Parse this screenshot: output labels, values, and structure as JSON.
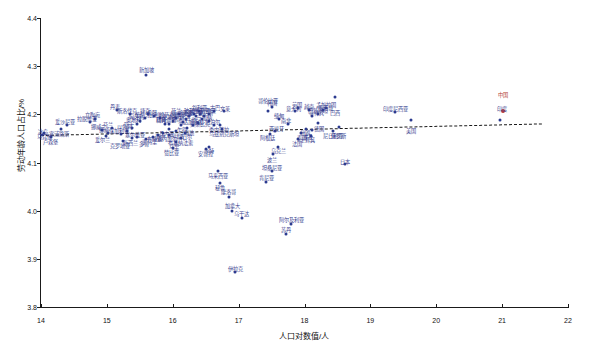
{
  "chart_data": {
    "type": "scatter",
    "title": "",
    "xlabel": "人口对数值/人",
    "ylabel": "劳动年龄人口占比/%",
    "xlim": [
      14,
      22
    ],
    "ylim": [
      3.8,
      4.4
    ],
    "xticks": [
      "14",
      "15",
      "16",
      "17",
      "18",
      "19",
      "20",
      "21",
      "22"
    ],
    "yticks": [
      "3.8",
      "3.9",
      "4.0",
      "4.1",
      "4.2",
      "4.3",
      "4.4"
    ],
    "grid": false,
    "legend": "none",
    "trendline": {
      "x0": 14.0,
      "y0": 4.158,
      "x1": 21.6,
      "y1": 4.182,
      "style": "dashed"
    },
    "highlight_color": "#c0392b",
    "point_color": "#2b3a8f",
    "label_color": "#3a3f8f",
    "points": [
      {
        "label": "中国",
        "x": 21.02,
        "y": 4.206,
        "highlight": true,
        "lx": 21.02,
        "ly": 4.243
      },
      {
        "label": "印度",
        "x": 20.97,
        "y": 4.189,
        "highlight": false,
        "lx": 21.0,
        "ly": 4.213
      },
      {
        "label": "美国",
        "x": 19.62,
        "y": 4.188,
        "highlight": false,
        "lx": 19.62,
        "ly": 4.168
      },
      {
        "label": "印度尼西亚",
        "x": 19.38,
        "y": 4.205,
        "highlight": false,
        "lx": 19.38,
        "ly": 4.213
      },
      {
        "label": "巴西",
        "x": 18.47,
        "y": 4.236,
        "highlight": false,
        "lx": 18.47,
        "ly": 4.205
      },
      {
        "label": "日本",
        "x": 18.62,
        "y": 4.096,
        "highlight": false,
        "lx": 18.62,
        "ly": 4.104
      },
      {
        "label": "俄罗斯",
        "x": 18.52,
        "y": 4.173,
        "highlight": false,
        "lx": 18.52,
        "ly": 4.158
      },
      {
        "label": "尼日利亚",
        "x": 18.44,
        "y": 4.166,
        "highlight": false,
        "lx": 18.44,
        "ly": 4.158
      },
      {
        "label": "孟加拉国",
        "x": 18.33,
        "y": 4.214,
        "highlight": false,
        "lx": 18.33,
        "ly": 4.222
      },
      {
        "label": "墨西哥",
        "x": 18.28,
        "y": 4.209,
        "highlight": false,
        "lx": 18.32,
        "ly": 4.216
      },
      {
        "label": "巴基斯坦",
        "x": 18.2,
        "y": 4.2,
        "highlight": false,
        "lx": 18.2,
        "ly": 4.208
      },
      {
        "label": "菲律宾",
        "x": 18.12,
        "y": 4.196,
        "highlight": false,
        "lx": 18.18,
        "ly": 4.204
      },
      {
        "label": "越南",
        "x": 18.07,
        "y": 4.21,
        "highlight": false,
        "lx": 18.07,
        "ly": 4.218
      },
      {
        "label": "埃及",
        "x": 18.03,
        "y": 4.17,
        "highlight": false,
        "lx": 18.06,
        "ly": 4.155
      },
      {
        "label": "德国",
        "x": 18.2,
        "y": 4.182,
        "highlight": false,
        "lx": 18.22,
        "ly": 4.172
      },
      {
        "label": "伊朗",
        "x": 18.12,
        "y": 4.168,
        "highlight": false,
        "lx": 18.0,
        "ly": 4.163
      },
      {
        "label": "土耳其",
        "x": 18.1,
        "y": 4.155,
        "highlight": false,
        "lx": 18.05,
        "ly": 4.148
      },
      {
        "label": "泰国",
        "x": 17.95,
        "y": 4.161,
        "highlight": false,
        "lx": 17.96,
        "ly": 4.152
      },
      {
        "label": "法国",
        "x": 17.9,
        "y": 4.148,
        "highlight": false,
        "lx": 17.88,
        "ly": 4.14
      },
      {
        "label": "英国",
        "x": 17.9,
        "y": 4.214,
        "highlight": false,
        "lx": 17.88,
        "ly": 4.222
      },
      {
        "label": "意大利",
        "x": 17.85,
        "y": 4.206,
        "highlight": false,
        "lx": 17.83,
        "ly": 4.214
      },
      {
        "label": "南非",
        "x": 17.75,
        "y": 4.18,
        "highlight": false,
        "lx": 17.72,
        "ly": 4.188
      },
      {
        "label": "缅甸",
        "x": 17.62,
        "y": 4.19,
        "highlight": false,
        "lx": 17.62,
        "ly": 4.198
      },
      {
        "label": "韩国",
        "x": 17.5,
        "y": 4.215,
        "highlight": false,
        "lx": 17.5,
        "ly": 4.226
      },
      {
        "label": "哥伦比亚",
        "x": 17.45,
        "y": 4.207,
        "highlight": false,
        "lx": 17.45,
        "ly": 4.23
      },
      {
        "label": "西班牙",
        "x": 17.55,
        "y": 4.165,
        "highlight": false,
        "lx": 17.58,
        "ly": 4.172
      },
      {
        "label": "阿根廷",
        "x": 17.48,
        "y": 4.16,
        "highlight": false,
        "lx": 17.44,
        "ly": 4.152
      },
      {
        "label": "乌克兰",
        "x": 17.6,
        "y": 4.132,
        "highlight": false,
        "lx": 17.6,
        "ly": 4.125
      },
      {
        "label": "波兰",
        "x": 17.52,
        "y": 4.118,
        "highlight": false,
        "lx": 17.5,
        "ly": 4.108
      },
      {
        "label": "坦桑尼亚",
        "x": 17.5,
        "y": 4.082,
        "highlight": false,
        "lx": 17.5,
        "ly": 4.09
      },
      {
        "label": "肯尼亚",
        "x": 17.42,
        "y": 4.06,
        "highlight": false,
        "lx": 17.42,
        "ly": 4.07
      },
      {
        "label": "阿尔及利亚",
        "x": 17.8,
        "y": 3.972,
        "highlight": false,
        "lx": 17.8,
        "ly": 3.982
      },
      {
        "label": "苏丹",
        "x": 17.72,
        "y": 3.952,
        "highlight": false,
        "lx": 17.72,
        "ly": 3.962
      },
      {
        "label": "乌干达",
        "x": 17.05,
        "y": 3.985,
        "highlight": false,
        "lx": 17.05,
        "ly": 3.995
      },
      {
        "label": "伊拉克",
        "x": 16.95,
        "y": 3.872,
        "highlight": false,
        "lx": 16.95,
        "ly": 3.882
      },
      {
        "label": "加拿大",
        "x": 16.9,
        "y": 4.0,
        "highlight": false,
        "lx": 16.9,
        "ly": 4.012
      },
      {
        "label": "摩洛哥",
        "x": 16.85,
        "y": 4.028,
        "highlight": false,
        "lx": 16.85,
        "ly": 4.04
      },
      {
        "label": "秘鲁",
        "x": 16.72,
        "y": 4.058,
        "highlight": false,
        "lx": 16.72,
        "ly": 4.05
      },
      {
        "label": "马来西亚",
        "x": 16.68,
        "y": 4.082,
        "highlight": false,
        "lx": 16.68,
        "ly": 4.074
      },
      {
        "label": "沙特",
        "x": 16.55,
        "y": 4.133,
        "highlight": false,
        "lx": 16.55,
        "ly": 4.125
      },
      {
        "label": "安哥拉",
        "x": 16.5,
        "y": 4.128,
        "highlight": false,
        "lx": 16.5,
        "ly": 4.12
      },
      {
        "label": "乌兹别克斯坦",
        "x": 16.75,
        "y": 4.17,
        "highlight": false,
        "lx": 16.78,
        "ly": 4.162
      },
      {
        "label": "委内瑞拉",
        "x": 16.72,
        "y": 4.178,
        "highlight": false,
        "lx": 16.7,
        "ly": 4.17
      },
      {
        "label": "尼泊尔",
        "x": 16.62,
        "y": 4.178,
        "highlight": false,
        "lx": 16.6,
        "ly": 4.186
      },
      {
        "label": "加纳",
        "x": 16.55,
        "y": 4.186,
        "highlight": false,
        "lx": 16.52,
        "ly": 4.194
      },
      {
        "label": "莫桑比克",
        "x": 16.45,
        "y": 4.19,
        "highlight": false,
        "lx": 16.42,
        "ly": 4.182
      },
      {
        "label": "也门",
        "x": 16.38,
        "y": 4.182,
        "highlight": false,
        "lx": 16.35,
        "ly": 4.19
      },
      {
        "label": "马达加斯加",
        "x": 16.3,
        "y": 4.178,
        "highlight": false,
        "lx": 16.27,
        "ly": 4.186
      },
      {
        "label": "澳大利亚",
        "x": 16.42,
        "y": 4.2,
        "highlight": false,
        "lx": 16.42,
        "ly": 4.208
      },
      {
        "label": "斯里兰卡",
        "x": 16.35,
        "y": 4.196,
        "highlight": false,
        "lx": 16.3,
        "ly": 4.204
      },
      {
        "label": "喀麦隆",
        "x": 16.25,
        "y": 4.196,
        "highlight": false,
        "lx": 16.2,
        "ly": 4.204
      },
      {
        "label": "罗马尼亚",
        "x": 16.2,
        "y": 4.19,
        "highlight": false,
        "lx": 16.12,
        "ly": 4.198
      },
      {
        "label": "智利",
        "x": 16.15,
        "y": 4.184,
        "highlight": false,
        "lx": 16.1,
        "ly": 4.192
      },
      {
        "label": "荷兰",
        "x": 16.1,
        "y": 4.2,
        "highlight": false,
        "lx": 16.05,
        "ly": 4.21
      },
      {
        "label": "哈萨克斯坦",
        "x": 16.05,
        "y": 4.192,
        "highlight": false,
        "lx": 15.98,
        "ly": 4.2
      },
      {
        "label": "柬埔寨",
        "x": 16.0,
        "y": 4.186,
        "highlight": false,
        "lx": 15.95,
        "ly": 4.196
      },
      {
        "label": "科特迪瓦",
        "x": 15.95,
        "y": 4.18,
        "highlight": false,
        "lx": 15.9,
        "ly": 4.19
      },
      {
        "label": "尼日尔",
        "x": 16.18,
        "y": 4.162,
        "highlight": false,
        "lx": 16.18,
        "ly": 4.155
      },
      {
        "label": "布基纳法索",
        "x": 16.12,
        "y": 4.15,
        "highlight": false,
        "lx": 16.12,
        "ly": 4.143
      },
      {
        "label": "马里",
        "x": 16.05,
        "y": 4.142,
        "highlight": false,
        "lx": 16.02,
        "ly": 4.134
      },
      {
        "label": "赞比亚",
        "x": 16.0,
        "y": 4.13,
        "highlight": false,
        "lx": 15.98,
        "ly": 4.122
      },
      {
        "label": "塞内加尔",
        "x": 15.95,
        "y": 4.158,
        "highlight": false,
        "lx": 15.92,
        "ly": 4.15
      },
      {
        "label": "瑞典",
        "x": 15.88,
        "y": 4.18,
        "highlight": false,
        "lx": 15.82,
        "ly": 4.19
      },
      {
        "label": "比利时",
        "x": 15.8,
        "y": 4.192,
        "highlight": false,
        "lx": 15.76,
        "ly": 4.2
      },
      {
        "label": "希腊",
        "x": 15.72,
        "y": 4.196,
        "highlight": false,
        "lx": 15.68,
        "ly": 4.205
      },
      {
        "label": "捷克",
        "x": 15.62,
        "y": 4.2,
        "highlight": false,
        "lx": 15.58,
        "ly": 4.21
      },
      {
        "label": "葡萄牙",
        "x": 15.58,
        "y": 4.192,
        "highlight": false,
        "lx": 15.54,
        "ly": 4.2
      },
      {
        "label": "匈牙利",
        "x": 15.5,
        "y": 4.186,
        "highlight": false,
        "lx": 15.45,
        "ly": 4.196
      },
      {
        "label": "奥地利",
        "x": 15.45,
        "y": 4.18,
        "highlight": false,
        "lx": 15.4,
        "ly": 4.19
      },
      {
        "label": "瑞士",
        "x": 15.38,
        "y": 4.172,
        "highlight": false,
        "lx": 15.34,
        "ly": 4.18
      },
      {
        "label": "以色列",
        "x": 15.3,
        "y": 4.166,
        "highlight": false,
        "lx": 15.26,
        "ly": 4.175
      },
      {
        "label": "保加利亚",
        "x": 15.22,
        "y": 4.16,
        "highlight": false,
        "lx": 15.18,
        "ly": 4.168
      },
      {
        "label": "新加坡",
        "x": 15.6,
        "y": 4.282,
        "highlight": false,
        "lx": 15.6,
        "ly": 4.294
      },
      {
        "label": "丹麦",
        "x": 15.15,
        "y": 4.21,
        "highlight": false,
        "lx": 15.12,
        "ly": 4.218
      },
      {
        "label": "芬兰",
        "x": 15.08,
        "y": 4.172,
        "highlight": false,
        "lx": 15.02,
        "ly": 4.18
      },
      {
        "label": "挪威",
        "x": 15.02,
        "y": 4.162,
        "highlight": false,
        "lx": 14.96,
        "ly": 4.17
      },
      {
        "label": "爱尔兰",
        "x": 14.98,
        "y": 4.156,
        "highlight": false,
        "lx": 14.93,
        "ly": 4.148
      },
      {
        "label": "新西兰",
        "x": 15.38,
        "y": 4.15,
        "highlight": false,
        "lx": 15.36,
        "ly": 4.142
      },
      {
        "label": "克罗地亚",
        "x": 15.25,
        "y": 4.145,
        "highlight": false,
        "lx": 15.2,
        "ly": 4.137
      },
      {
        "label": "立陶宛",
        "x": 14.82,
        "y": 4.19,
        "highlight": false,
        "lx": 14.78,
        "ly": 4.2
      },
      {
        "label": "拉脱维亚",
        "x": 14.75,
        "y": 4.184,
        "highlight": false,
        "lx": 14.7,
        "ly": 4.192
      },
      {
        "label": "爱沙尼亚",
        "x": 14.4,
        "y": 4.178,
        "highlight": false,
        "lx": 14.36,
        "ly": 4.186
      },
      {
        "label": "塞浦路斯",
        "x": 14.3,
        "y": 4.17,
        "highlight": false,
        "lx": 14.28,
        "ly": 4.162
      },
      {
        "label": "卢森堡",
        "x": 14.15,
        "y": 4.152,
        "highlight": false,
        "lx": 14.15,
        "ly": 4.144
      },
      {
        "label": "马耳他",
        "x": 14.05,
        "y": 4.162,
        "highlight": false,
        "lx": 14.06,
        "ly": 4.154
      },
      {
        "label": "冰岛",
        "x": 14.02,
        "y": 4.158,
        "highlight": false,
        "lx": 14.03,
        "ly": 4.166
      },
      {
        "label": "文莱",
        "x": 16.78,
        "y": 4.206,
        "highlight": false,
        "lx": 16.8,
        "ly": 4.214
      },
      {
        "label": "古巴",
        "x": 16.62,
        "y": 4.206,
        "highlight": false,
        "lx": 16.64,
        "ly": 4.216
      },
      {
        "label": "约旦",
        "x": 16.55,
        "y": 4.2,
        "highlight": false,
        "lx": 16.58,
        "ly": 4.208
      },
      {
        "label": "突尼斯",
        "x": 16.48,
        "y": 4.196,
        "highlight": false,
        "lx": 16.5,
        "ly": 4.204
      },
      {
        "label": "叙利亚",
        "x": 16.4,
        "y": 4.206,
        "highlight": false,
        "lx": 16.4,
        "ly": 4.216
      },
      {
        "label": "玻利维亚",
        "x": 16.32,
        "y": 4.2,
        "highlight": false,
        "lx": 16.32,
        "ly": 4.21
      },
      {
        "label": "海地",
        "x": 16.22,
        "y": 4.172,
        "highlight": false,
        "lx": 16.24,
        "ly": 4.164
      },
      {
        "label": "乍得",
        "x": 16.12,
        "y": 4.178,
        "highlight": false,
        "lx": 16.14,
        "ly": 4.17
      },
      {
        "label": "卢旺达",
        "x": 16.05,
        "y": 4.166,
        "highlight": false,
        "lx": 16.06,
        "ly": 4.158
      },
      {
        "label": "几内亚",
        "x": 15.95,
        "y": 4.17,
        "highlight": false,
        "lx": 15.9,
        "ly": 4.162
      },
      {
        "label": "贝宁",
        "x": 15.85,
        "y": 4.162,
        "highlight": false,
        "lx": 15.8,
        "ly": 4.154
      },
      {
        "label": "布隆迪",
        "x": 15.78,
        "y": 4.158,
        "highlight": false,
        "lx": 15.72,
        "ly": 4.15
      },
      {
        "label": "索马里",
        "x": 15.7,
        "y": 4.152,
        "highlight": false,
        "lx": 15.64,
        "ly": 4.144
      },
      {
        "label": "多哥",
        "x": 15.6,
        "y": 4.148,
        "highlight": false,
        "lx": 15.56,
        "ly": 4.14
      },
      {
        "label": "塞尔维亚",
        "x": 15.45,
        "y": 4.152,
        "highlight": false,
        "lx": 15.42,
        "ly": 4.16
      },
      {
        "label": "斯洛伐克",
        "x": 15.35,
        "y": 4.2,
        "highlight": false,
        "lx": 15.3,
        "ly": 4.208
      },
      {
        "label": "挪威二",
        "x": 14.92,
        "y": 4.168,
        "highlight": false,
        "lx": 14.88,
        "ly": 4.176
      }
    ]
  }
}
